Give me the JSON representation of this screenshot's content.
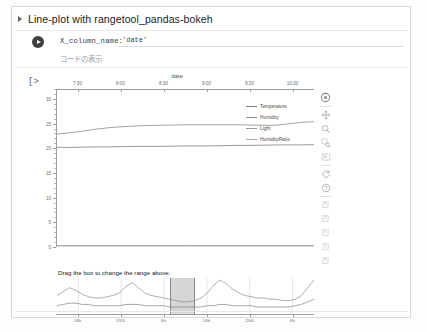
{
  "cell": {
    "title": "Line-plot with rangetool_pandas-bokeh",
    "expand_icon": "triangle-right-icon",
    "run_icon": "play-icon"
  },
  "form": {
    "label": "X_column_name:",
    "value": "'date'",
    "placeholder": "'date'",
    "show_code_label": "コードの表示"
  },
  "output": {
    "prompt": "[>"
  },
  "chart_data": {
    "type": "line",
    "title": "date",
    "xlabel": "",
    "ylabel": "",
    "ylim": [
      0,
      32
    ],
    "yticks": [
      0,
      5,
      10,
      15,
      20,
      25,
      30
    ],
    "xticks": [
      "7:30",
      "8:00",
      "8:30",
      "9:00",
      "9:30",
      "10:00"
    ],
    "grid": false,
    "legend_position": "top-right",
    "x": [
      0,
      5,
      10,
      15,
      20,
      25,
      30,
      35,
      40,
      45,
      50,
      55,
      60,
      65,
      70,
      75,
      80,
      85,
      90,
      95,
      100
    ],
    "series": [
      {
        "name": "Temperature",
        "color": "#7f7f7f",
        "values": [
          20.1,
          20.1,
          20.15,
          20.2,
          20.2,
          20.25,
          20.3,
          20.3,
          20.3,
          20.35,
          20.4,
          20.4,
          20.4,
          20.45,
          20.5,
          20.5,
          20.55,
          20.6,
          20.6,
          20.6,
          20.65
        ]
      },
      {
        "name": "Humidity",
        "color": "#8c8c8c",
        "values": [
          22.8,
          23.1,
          23.4,
          23.8,
          24.1,
          24.3,
          24.45,
          24.55,
          24.6,
          24.65,
          24.7,
          24.7,
          24.7,
          24.7,
          24.7,
          24.65,
          24.6,
          24.6,
          24.9,
          25.2,
          25.35
        ]
      },
      {
        "name": "Light",
        "color": "#9a9a9a",
        "values": [
          0.1,
          0.1,
          0.1,
          0.1,
          0.1,
          0.1,
          0.1,
          0.1,
          0.1,
          0.1,
          0.1,
          0.1,
          0.1,
          0.1,
          0.1,
          0.1,
          0.1,
          0.1,
          0.1,
          0.1,
          0.1
        ]
      },
      {
        "name": "HumidityRatio",
        "color": "#a8a8a8",
        "values": [
          0.0,
          0.0,
          0.0,
          0.0,
          0.0,
          0.0,
          0.0,
          0.0,
          0.0,
          0.0,
          0.0,
          0.0,
          0.0,
          0.0,
          0.0,
          0.0,
          0.0,
          0.0,
          0.0,
          0.0,
          0.0
        ]
      }
    ]
  },
  "range_tool": {
    "hint": "Drag the box to change the range above.",
    "xticks": [
      "18h",
      "2/03",
      "6h",
      "16h",
      "2/04",
      "6h"
    ],
    "selection_start_pct": 44,
    "selection_width_pct": 9,
    "series": [
      {
        "name": "Humidity",
        "color": "#8c8c8c",
        "values": [
          38,
          41,
          44,
          42,
          39,
          37,
          36,
          36,
          37,
          38,
          40,
          45,
          48,
          44,
          40,
          38,
          37,
          36,
          35,
          34,
          33,
          33,
          34,
          36,
          40,
          46,
          50,
          47,
          43,
          40,
          38,
          37,
          36,
          36,
          35,
          35,
          34,
          34,
          35,
          38,
          44,
          50
        ]
      },
      {
        "name": "Temperature",
        "color": "#7f7f7f",
        "values": [
          30,
          31,
          32,
          32,
          31,
          31,
          30,
          30,
          30,
          30,
          30,
          31,
          31,
          31,
          30,
          30,
          30,
          30,
          29,
          29,
          29,
          29,
          29,
          29,
          30,
          30,
          31,
          31,
          30,
          30,
          30,
          30,
          29,
          29,
          29,
          29,
          29,
          29,
          30,
          31,
          33,
          35
        ]
      }
    ]
  },
  "toolbar": {
    "items": [
      {
        "name": "bokeh-logo-icon",
        "label": "Bokeh"
      },
      {
        "name": "pan-icon",
        "label": "Pan"
      },
      {
        "name": "zoom-in-icon",
        "label": "Wheel Zoom"
      },
      {
        "name": "box-zoom-icon",
        "label": "Box Zoom"
      },
      {
        "name": "box-select-icon",
        "label": "Box Select"
      },
      {
        "name": "reset-icon",
        "label": "Reset"
      },
      {
        "name": "help-icon",
        "label": "Help"
      },
      {
        "name": "save-icon",
        "label": "Save"
      }
    ]
  },
  "colors": {
    "axis": "#9e9e9e",
    "text": "#6b6b6b",
    "selection": "#787878"
  }
}
